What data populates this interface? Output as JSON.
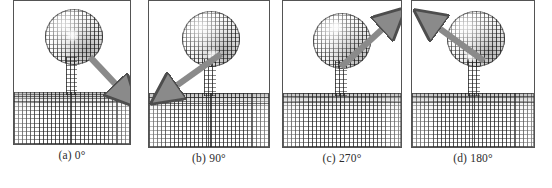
{
  "figure": {
    "type": "micromagnetic-simulation-panel-series",
    "background_color": "#ffffff",
    "arrow_color": "#8a8a8a",
    "arrow_outline_color": "#4d4d4d",
    "border_color": "#545454",
    "caption_color": "#2d2d2d",
    "panel_count": 4
  },
  "panels": [
    {
      "id": "panel-a",
      "label": "(a) 0°",
      "letter": "(a)",
      "angle": "0°",
      "angle_value": 0,
      "arrow_direction": "down-right",
      "arrow_angle_deg": 45,
      "arrow": {
        "x1": 76,
        "y1": 56,
        "x2": 112,
        "y2": 94
      }
    },
    {
      "id": "panel-b",
      "label": "(b) 90°",
      "letter": "(b)",
      "angle": "90°",
      "angle_value": 90,
      "arrow_direction": "down-left",
      "arrow_angle_deg": 135,
      "arrow": {
        "x1": 74,
        "y1": 54,
        "x2": 16,
        "y2": 95
      }
    },
    {
      "id": "panel-c",
      "label": "(c) 270°",
      "letter": "(c)",
      "angle": "270°",
      "angle_value": 270,
      "arrow_direction": "up-right",
      "arrow_angle_deg": -40,
      "arrow": {
        "x1": 58,
        "y1": 68,
        "x2": 112,
        "y2": 20
      }
    },
    {
      "id": "panel-d",
      "label": "(d) 180°",
      "letter": "(d)",
      "angle": "180°",
      "angle_value": 180,
      "arrow_direction": "up-left",
      "arrow_angle_deg": -140,
      "arrow": {
        "x1": 72,
        "y1": 62,
        "x2": 14,
        "y2": 18
      }
    }
  ],
  "structure": {
    "head_name": "circular-disc-element",
    "neck_name": "vertical-nanowire-stem",
    "slab_name": "horizontal-substrate-layer",
    "field_name": "vector-field-arrow-grid"
  }
}
